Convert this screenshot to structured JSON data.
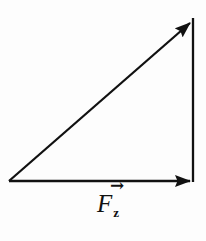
{
  "diagram": {
    "type": "force-vector-triangle",
    "background": "#fdfdfd",
    "line_color": "#111111",
    "label": {
      "arrow_glyph": "→",
      "symbol": "F",
      "subscript": "z"
    },
    "vectors": [
      {
        "name": "resultant-vector",
        "x1": 9,
        "y1": 181,
        "x2": 190,
        "y2": 23,
        "arrow": true
      },
      {
        "name": "horizontal-force-vector",
        "x1": 9,
        "y1": 181,
        "x2": 190,
        "y2": 181,
        "arrow": true
      },
      {
        "name": "vertical-side-line",
        "x1": 193,
        "y1": 18,
        "x2": 193,
        "y2": 182,
        "arrow": false
      }
    ]
  }
}
